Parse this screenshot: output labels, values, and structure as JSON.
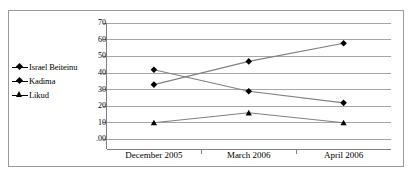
{
  "chart_data": {
    "type": "line",
    "title": "",
    "xlabel": "",
    "ylabel": "",
    "categories": [
      "December 2005",
      "March 2006",
      "April 2006"
    ],
    "series": [
      {
        "name": "Israel Beiteinu",
        "values": [
          42,
          29,
          22
        ],
        "marker": "diamond"
      },
      {
        "name": "Kadima",
        "values": [
          33,
          47,
          58
        ],
        "marker": "diamond"
      },
      {
        "name": "Likud",
        "values": [
          10,
          16,
          10
        ],
        "marker": "triangle"
      }
    ],
    "ylim": [
      0,
      70
    ],
    "yticks": [
      70,
      60,
      50,
      40,
      30,
      20,
      10,
      0
    ],
    "ytick_labels": [
      "70",
      "60",
      "50",
      "40",
      "30",
      "20",
      "10",
      ".00"
    ],
    "grid": true,
    "legend_position": "left",
    "colors": {
      "line": "#808080",
      "marker": "#000000",
      "grid": "#a6a6a6",
      "axis": "#808080"
    }
  },
  "legend": {
    "items": [
      {
        "label": "Israel Beiteinu"
      },
      {
        "label": "Kadima"
      },
      {
        "label": "Likud"
      }
    ]
  }
}
